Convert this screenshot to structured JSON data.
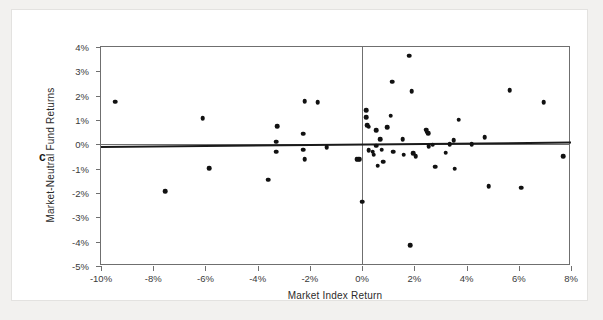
{
  "panel": {
    "letter": "c"
  },
  "annotation": {
    "line1": "y = 0.0101",
    "line2": "x = 0.0002"
  },
  "colors": {
    "point": "#111111",
    "fitline": "#1a1a1a",
    "axis": "#6f6f6f",
    "card": "#ffffff",
    "page": "#f2f1ef"
  },
  "chart_data": {
    "type": "scatter",
    "title": "",
    "xlabel": "Market Index Return",
    "ylabel": "Market-Neutral Fund Returns",
    "annotations": [
      "y = 0.0101",
      "x = 0.0002"
    ],
    "panel_label": "c",
    "grid": false,
    "legend": null,
    "xlim": [
      -10,
      8
    ],
    "ylim": [
      -5,
      4
    ],
    "xticks": [
      -10,
      -8,
      -6,
      -4,
      -2,
      0,
      2,
      4,
      6,
      8
    ],
    "xticklabels": [
      "-10%",
      "-8%",
      "-6%",
      "-4%",
      "-2%",
      "0%",
      "2%",
      "4%",
      "6%",
      "8%"
    ],
    "yticks": [
      4,
      3,
      2,
      1,
      0,
      -1,
      -2,
      -3,
      -4,
      -5
    ],
    "yticklabels": [
      "4%",
      "3%",
      "2%",
      "1%",
      "0%",
      "-1%",
      "-2%",
      "-3%",
      "-4%",
      "-5%"
    ],
    "zero_lines": {
      "horizontal": 0,
      "vertical": 0
    },
    "fit_line": {
      "intercept": 0.0002,
      "slope": 0.0101,
      "x_start": -10,
      "x_end": 8,
      "y_start": -0.07,
      "y_end": 0.11
    },
    "points": [
      [
        -9.45,
        1.75
      ],
      [
        -7.55,
        -1.92
      ],
      [
        -6.1,
        1.08
      ],
      [
        -5.85,
        -0.98
      ],
      [
        -3.6,
        -1.45
      ],
      [
        -3.25,
        0.75
      ],
      [
        -3.3,
        0.1
      ],
      [
        -3.3,
        -0.3
      ],
      [
        -2.2,
        1.78
      ],
      [
        -2.25,
        0.43
      ],
      [
        -2.25,
        -0.22
      ],
      [
        -2.2,
        -0.6
      ],
      [
        -1.7,
        1.73
      ],
      [
        -1.35,
        -0.13
      ],
      [
        -0.15,
        -0.62
      ],
      [
        -0.1,
        -0.62
      ],
      [
        -0.2,
        -0.6
      ],
      [
        0.0,
        -2.35
      ],
      [
        0.15,
        1.4
      ],
      [
        0.15,
        1.12
      ],
      [
        0.2,
        0.78
      ],
      [
        0.25,
        0.72
      ],
      [
        0.25,
        -0.25
      ],
      [
        0.4,
        -0.3
      ],
      [
        0.45,
        -0.42
      ],
      [
        0.55,
        0.58
      ],
      [
        0.55,
        -0.05
      ],
      [
        0.6,
        -0.88
      ],
      [
        0.7,
        0.22
      ],
      [
        0.75,
        -0.22
      ],
      [
        0.8,
        -0.72
      ],
      [
        0.95,
        0.7
      ],
      [
        1.1,
        1.18
      ],
      [
        1.15,
        2.58
      ],
      [
        1.2,
        -0.3
      ],
      [
        1.55,
        0.22
      ],
      [
        1.6,
        -0.42
      ],
      [
        1.8,
        3.65
      ],
      [
        1.85,
        -4.15
      ],
      [
        1.9,
        2.18
      ],
      [
        1.95,
        -0.37
      ],
      [
        2.05,
        -0.48
      ],
      [
        2.45,
        0.6
      ],
      [
        2.48,
        0.52
      ],
      [
        2.52,
        0.45
      ],
      [
        2.55,
        -0.08
      ],
      [
        2.7,
        -0.02
      ],
      [
        2.8,
        -0.92
      ],
      [
        3.2,
        -0.35
      ],
      [
        3.35,
        0.0
      ],
      [
        3.5,
        0.18
      ],
      [
        3.55,
        -1.0
      ],
      [
        3.7,
        1.02
      ],
      [
        4.2,
        0.0
      ],
      [
        4.7,
        0.3
      ],
      [
        4.85,
        -1.72
      ],
      [
        5.65,
        2.22
      ],
      [
        6.1,
        -1.78
      ],
      [
        6.95,
        1.72
      ],
      [
        7.7,
        -0.48
      ]
    ]
  }
}
